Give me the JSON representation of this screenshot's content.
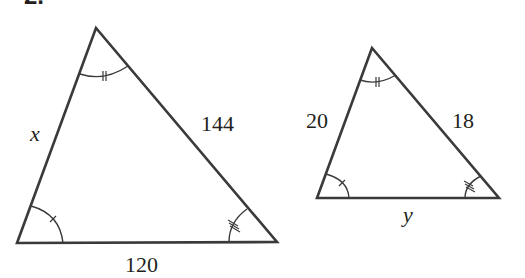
{
  "problem_number": "2.",
  "stroke_color": "#3a3a3a",
  "triangles": [
    {
      "name": "large-triangle",
      "vertices": {
        "apex": [
          96,
          28
        ],
        "bottom_left": [
          17,
          243
        ],
        "bottom_right": [
          277,
          242
        ]
      },
      "labels": {
        "left_side": "x",
        "right_side": "144",
        "base": "120"
      },
      "angle_marks": {
        "apex": "double-tick",
        "bottom_left": "single-tick",
        "bottom_right": "triple-tick"
      }
    },
    {
      "name": "small-triangle",
      "vertices": {
        "apex": [
          372,
          48
        ],
        "bottom_left": [
          317,
          198
        ],
        "bottom_right": [
          499,
          198
        ]
      },
      "labels": {
        "left_side": "20",
        "right_side": "18",
        "base": "y"
      },
      "angle_marks": {
        "apex": "double-tick",
        "bottom_left": "single-tick",
        "bottom_right": "triple-tick"
      }
    }
  ]
}
